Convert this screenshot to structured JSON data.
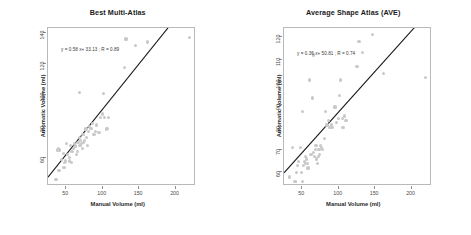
{
  "figure": {
    "background": "#ffffff",
    "point_color": "#c9c9c9",
    "line_color": "#1a1a1a",
    "frame_color": "#b9b9b9"
  },
  "chart_data": [
    {
      "type": "scatter",
      "title": "Best Multi-Atlas",
      "xlabel": "Manual Volume (ml)",
      "ylabel": "Automatic Volume (ml)",
      "annotation": "y = 0.58 x+ 33.13 ; R = 0.89",
      "slope": 0.58,
      "intercept": 33.13,
      "r": 0.89,
      "grid": false,
      "legend": "none",
      "xlim": [
        25,
        228
      ],
      "ylim": [
        42,
        143
      ],
      "xticks": [
        50,
        100,
        150,
        200
      ],
      "yticks": [
        60,
        80,
        100,
        120,
        140
      ],
      "x": [
        36,
        38,
        39,
        40,
        41,
        44,
        46,
        47,
        48,
        49,
        50,
        52,
        54,
        55,
        56,
        57,
        58,
        60,
        61,
        62,
        63,
        64,
        65,
        66,
        67,
        68,
        68,
        69,
        70,
        71,
        72,
        73,
        74,
        75,
        76,
        77,
        78,
        79,
        80,
        82,
        84,
        86,
        88,
        90,
        92,
        95,
        97,
        100,
        101,
        103,
        105,
        106,
        108,
        130,
        132,
        145,
        161,
        219
      ],
      "y": [
        46,
        65,
        66,
        52,
        65,
        59,
        63,
        54,
        57,
        58,
        69,
        62,
        58,
        60,
        68,
        57,
        64,
        66,
        69,
        67,
        68,
        62,
        70,
        64,
        70,
        73,
        102,
        68,
        71,
        69,
        66,
        75,
        70,
        71,
        78,
        79,
        73,
        68,
        77,
        80,
        79,
        82,
        75,
        77,
        81,
        76,
        86,
        88,
        101,
        86,
        78,
        79,
        86,
        118,
        136,
        132,
        134,
        137
      ]
    },
    {
      "type": "scatter",
      "title": "Average Shape Atlas (AVE)",
      "xlabel": "Manual Volume (ml)",
      "ylabel": "Automatic Volume (ml)",
      "annotation": "y = 0.36 x+ 50.81 ; R = 0.74",
      "slope": 0.36,
      "intercept": 50.81,
      "r": 0.74,
      "grid": false,
      "legend": "none",
      "xlim": [
        25,
        228
      ],
      "ylim": [
        54,
        124
      ],
      "xticks": [
        50,
        100,
        150,
        200
      ],
      "yticks": [
        60,
        70,
        80,
        90,
        100,
        110,
        120
      ],
      "x": [
        32,
        37,
        40,
        41,
        42,
        44,
        45,
        48,
        49,
        50,
        50,
        52,
        53,
        54,
        55,
        56,
        57,
        58,
        60,
        62,
        64,
        65,
        66,
        67,
        68,
        69,
        70,
        71,
        72,
        73,
        74,
        75,
        76,
        78,
        80,
        82,
        84,
        86,
        88,
        90,
        92,
        95,
        97,
        100,
        101,
        103,
        105,
        106,
        108,
        110,
        125,
        128,
        133,
        146,
        162,
        219
      ],
      "y": [
        58,
        71,
        56,
        56,
        60,
        63,
        65,
        71,
        60,
        87,
        56,
        63,
        65,
        67,
        64,
        66,
        64,
        62,
        101,
        68,
        93,
        112,
        69,
        67,
        70,
        72,
        66,
        64,
        67,
        70,
        68,
        72,
        71,
        70,
        75,
        87,
        81,
        83,
        80,
        81,
        80,
        89,
        82,
        84,
        94,
        101,
        84,
        80,
        85,
        83,
        107,
        118,
        113,
        121,
        104,
        102
      ]
    }
  ]
}
